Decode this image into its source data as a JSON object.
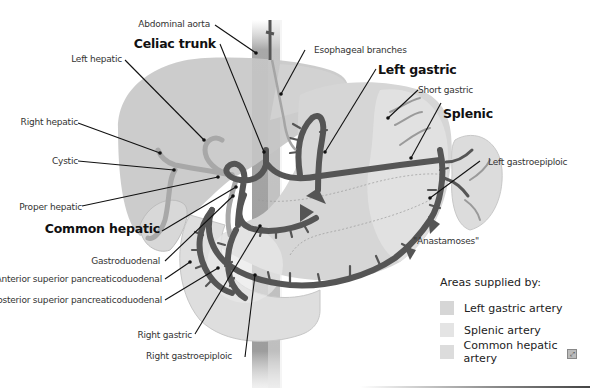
{
  "labels": {
    "abdominal_aorta": "Abdominal aorta",
    "celiac_trunk": "Celiac trunk",
    "esophageal_branches": "Esophageal branches",
    "left_hepatic": "Left hepatic",
    "left_gastric": "Left gastric",
    "short_gastric": "Short gastric",
    "splenic": "Splenic",
    "right_hepatic": "Right hepatic",
    "cystic": "Cystic",
    "left_gastroepiploic": "Left gastroepiploic",
    "proper_hepatic": "Proper hepatic",
    "common_hepatic": "Common hepatic",
    "anastamoses": "\"Anastamoses\"",
    "gastroduodenal": "Gastroduodenal",
    "anterior_superior_pancreaticoduodenal": "Anterior superior pancreaticoduodenal",
    "posterior_superior_pancreaticoduodenal": "Posterior superior pancreaticoduodenal",
    "right_gastric": "Right gastric",
    "right_gastroepiploic": "Right gastroepiploic"
  },
  "legend": {
    "title": "Areas supplied by:",
    "items": [
      {
        "label": "Left gastric artery",
        "color": "#d6d6d6"
      },
      {
        "label": "Splenic artery",
        "color": "#e4e4e4"
      },
      {
        "label": "Common hepatic artery",
        "color": "#dcdcdc"
      }
    ]
  },
  "colors": {
    "artery": "#5a5a5a",
    "artery_outline": "#3c3c3c",
    "liver": "#c9c9c9",
    "stomach": "#d8d8d8",
    "aorta": "#a9a9a9",
    "duodenum": "#e2e2e2",
    "spleen": "#dedede",
    "leader": "#111111"
  },
  "zoom_icon": "expand-icon"
}
